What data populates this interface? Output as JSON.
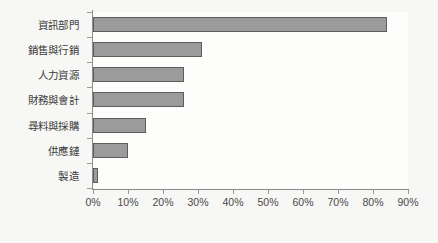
{
  "chart_data": {
    "type": "bar",
    "orientation": "horizontal",
    "title": "",
    "xlabel": "",
    "ylabel": "",
    "categories": [
      "資訊部門",
      "銷售與行銷",
      "人力資源",
      "財務與會計",
      "尋料與採購",
      "供應鏈",
      "製造"
    ],
    "values": [
      84,
      31,
      26,
      26,
      15,
      10,
      1.5
    ],
    "xlim": [
      0,
      90
    ],
    "xtick_labels": [
      "0%",
      "10%",
      "20%",
      "30%",
      "40%",
      "50%",
      "60%",
      "70%",
      "80%",
      "90%"
    ],
    "xtick_values": [
      0,
      10,
      20,
      30,
      40,
      50,
      60,
      70,
      80,
      90
    ],
    "grid": false,
    "legend": false,
    "colors": {
      "bar_fill": "#9b9b9b",
      "bar_border": "#5d5d5d",
      "axis": "#8d8d8d",
      "text": "#3a3a3a",
      "background": "#f7f7f5",
      "plot_background": "#fdfdfc"
    }
  }
}
